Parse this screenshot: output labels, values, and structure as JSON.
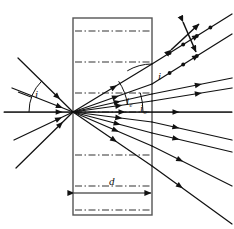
{
  "figure": {
    "type": "optics-ray-diagram",
    "background_color": "#ffffff",
    "stroke_color": "#111111",
    "slab_fill": "#ffffff",
    "slab_stroke": "#555555",
    "axis_color": "#7a7a7a",
    "canvas": {
      "width": 234,
      "height": 229
    }
  },
  "labels": {
    "incidence_angle": "i",
    "exit_angle": "i",
    "extraordinary_angle": "i",
    "extraordinary_sub": "e",
    "ordinary_angle": "i",
    "ordinary_sub": "o",
    "thickness": "d"
  },
  "slab": {
    "name": "birefringent-crystal-slab",
    "x": 73,
    "y": 18,
    "width": 79,
    "height": 197,
    "optic_axis_line_style": "dash-dot",
    "optic_axis_rows_y": [
      31,
      62,
      93,
      112,
      155,
      186,
      210
    ]
  },
  "dimension": {
    "label": "d",
    "y": 193,
    "x_start": 74,
    "x_end": 151,
    "label_x": 112,
    "label_y": 181
  },
  "incident_rays": [
    {
      "name": "incident-ray-upper",
      "x1": 18,
      "y1": 58,
      "x2": 73,
      "y2": 112,
      "arrow_t": 0.72
    },
    {
      "name": "incident-ray-axis",
      "x1": 4,
      "y1": 112,
      "x2": 73,
      "y2": 112,
      "arrow_t": 0.8
    },
    {
      "name": "incident-ray-mid",
      "x1": 12,
      "y1": 88,
      "x2": 73,
      "y2": 112,
      "arrow_t": 0.78
    },
    {
      "name": "incident-ray-lower",
      "x1": 14,
      "y1": 140,
      "x2": 73,
      "y2": 112,
      "arrow_t": 0.76
    },
    {
      "name": "incident-ray-lowest",
      "x1": 16,
      "y1": 168,
      "x2": 73,
      "y2": 112,
      "arrow_t": 0.78
    }
  ],
  "internal_rays": [
    {
      "name": "internal-ray-e1",
      "x1": 73,
      "y1": 112,
      "x2": 152,
      "y2": 64,
      "arrow_t": 0.52
    },
    {
      "name": "internal-ray-e2",
      "x1": 73,
      "y1": 112,
      "x2": 152,
      "y2": 84,
      "arrow_t": 0.54
    },
    {
      "name": "internal-ray-e3",
      "x1": 73,
      "y1": 112,
      "x2": 152,
      "y2": 94,
      "arrow_t": 0.56
    },
    {
      "name": "internal-ray-e4",
      "x1": 73,
      "y1": 112,
      "x2": 152,
      "y2": 101,
      "arrow_t": 0.58
    },
    {
      "name": "internal-ray-o",
      "x1": 73,
      "y1": 112,
      "x2": 152,
      "y2": 112,
      "arrow_t": 0.62
    },
    {
      "name": "internal-ray-d1",
      "x1": 73,
      "y1": 112,
      "x2": 152,
      "y2": 122,
      "arrow_t": 0.58
    },
    {
      "name": "internal-ray-d2",
      "x1": 73,
      "y1": 112,
      "x2": 152,
      "y2": 133,
      "arrow_t": 0.56
    },
    {
      "name": "internal-ray-d3",
      "x1": 73,
      "y1": 112,
      "x2": 152,
      "y2": 146,
      "arrow_t": 0.54
    },
    {
      "name": "internal-ray-d4",
      "x1": 73,
      "y1": 112,
      "x2": 152,
      "y2": 166,
      "arrow_t": 0.52
    }
  ],
  "exit_rays": [
    {
      "name": "exit-ray-upper-1",
      "x1": 152,
      "y1": 64,
      "x2": 232,
      "y2": 14,
      "arrow_t": 0.55,
      "beads": true
    },
    {
      "name": "exit-ray-upper-2",
      "x1": 152,
      "y1": 84,
      "x2": 232,
      "y2": 34,
      "arrow_t": 0.55,
      "beads": true
    },
    {
      "name": "exit-ray-mid-1",
      "x1": 152,
      "y1": 94,
      "x2": 232,
      "y2": 78,
      "arrow_t": 0.58,
      "beads": false
    },
    {
      "name": "exit-ray-mid-2",
      "x1": 152,
      "y1": 101,
      "x2": 232,
      "y2": 88,
      "arrow_t": 0.58,
      "beads": false
    },
    {
      "name": "exit-ray-axis",
      "x1": 152,
      "y1": 112,
      "x2": 232,
      "y2": 112,
      "arrow_t": 0.3,
      "beads": false
    },
    {
      "name": "exit-ray-low-1",
      "x1": 152,
      "y1": 122,
      "x2": 232,
      "y2": 140,
      "arrow_t": 0.3,
      "beads": false
    },
    {
      "name": "exit-ray-low-2",
      "x1": 152,
      "y1": 133,
      "x2": 232,
      "y2": 152,
      "arrow_t": 0.3,
      "beads": false
    },
    {
      "name": "exit-ray-low-3",
      "x1": 152,
      "y1": 146,
      "x2": 232,
      "y2": 186,
      "arrow_t": 0.35,
      "beads": false
    },
    {
      "name": "exit-ray-low-4",
      "x1": 152,
      "y1": 166,
      "x2": 232,
      "y2": 224,
      "arrow_t": 0.35,
      "beads": false
    }
  ],
  "polarization_markers": {
    "name": "polarization-double-arrows",
    "arrows": [
      {
        "name": "pol-arrow-diagonal",
        "x1": 171,
        "y1": 50,
        "x2": 199,
        "y2": 24
      },
      {
        "name": "pol-arrow-vertical",
        "x1": 183,
        "y1": 22,
        "x2": 196,
        "y2": 52
      }
    ],
    "bead_counts": {
      "exit-ray-upper-1": 4,
      "exit-ray-upper-2": 3
    }
  },
  "angle_arcs": [
    {
      "name": "arc-incidence-i",
      "cx": 73,
      "cy": 112,
      "r": 44,
      "a_start": 180,
      "a_end": 225
    },
    {
      "name": "arc-exit-i",
      "cx": 152,
      "cy": 112,
      "r": 48,
      "a_start": 239,
      "a_end": 270
    },
    {
      "name": "arc-ie",
      "cx": 73,
      "cy": 112,
      "r": 55,
      "a_start": 326,
      "a_end": 352
    },
    {
      "name": "arc-io",
      "cx": 73,
      "cy": 112,
      "r": 70,
      "a_start": 344,
      "a_end": 360
    }
  ],
  "label_positions": {
    "incidence_i": {
      "x": 35,
      "y": 98
    },
    "incidence_tick": {
      "x1": 18,
      "y1": 92,
      "x2": 31,
      "y2": 97
    },
    "exit_i": {
      "x": 158,
      "y": 80
    },
    "ie": {
      "x": 126,
      "y": 105
    },
    "ie_sub": {
      "x": 131,
      "y": 108
    },
    "io": {
      "x": 140,
      "y": 112
    },
    "io_sub": {
      "x": 145,
      "y": 115
    },
    "thickness_d": {
      "x": 109,
      "y": 185
    }
  }
}
